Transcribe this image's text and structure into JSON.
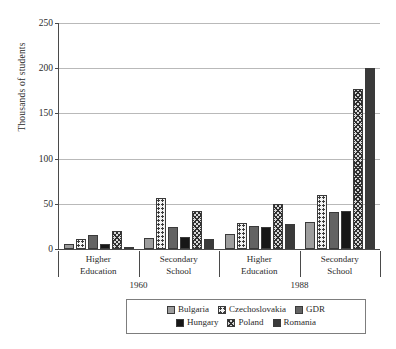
{
  "chart_data": {
    "type": "bar",
    "title": "",
    "xlabel": "",
    "ylabel": "Thousands of students",
    "ylim": [
      0,
      250
    ],
    "yticks": [
      0,
      50,
      100,
      150,
      200,
      250
    ],
    "grid": true,
    "legend_position": "bottom",
    "categories": [
      "Higher Education",
      "Secondary School",
      "Higher Education",
      "Secondary School"
    ],
    "category_lines": [
      [
        "Higher",
        "Education"
      ],
      [
        "Secondary",
        "School"
      ],
      [
        "Higher",
        "Education"
      ],
      [
        "Secondary",
        "School"
      ]
    ],
    "era_groups": [
      {
        "label": "1960",
        "categories": [
          0,
          1
        ]
      },
      {
        "label": "1988",
        "categories": [
          2,
          3
        ]
      }
    ],
    "series": [
      {
        "name": "Bulgaria",
        "pattern": "solid-light-gray",
        "color": "#9d9d9d",
        "values": [
          5,
          12,
          17,
          30
        ]
      },
      {
        "name": "Czechoslovakia",
        "pattern": "dotted-white",
        "color": "#f2f2f2",
        "values": [
          11,
          56,
          29,
          60
        ]
      },
      {
        "name": "GDR",
        "pattern": "solid-mid-gray",
        "color": "#636363",
        "values": [
          15,
          24,
          25,
          41
        ]
      },
      {
        "name": "Hungary",
        "pattern": "solid-black",
        "color": "#171717",
        "values": [
          5,
          13,
          24,
          42
        ]
      },
      {
        "name": "Poland",
        "pattern": "crosshatch",
        "color": "#d8d8d8",
        "values": [
          20,
          42,
          50,
          177
        ]
      },
      {
        "name": "Romania",
        "pattern": "solid-dark-gray",
        "color": "#3a3a3a",
        "values": [
          2,
          11,
          28,
          200
        ]
      }
    ]
  }
}
